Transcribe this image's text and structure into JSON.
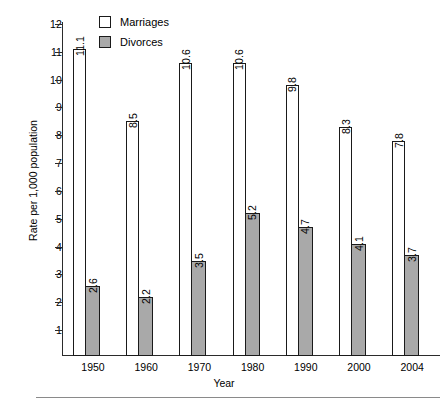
{
  "chart_data": {
    "type": "bar",
    "title": "",
    "xlabel": "Year",
    "ylabel": "Rate per 1,000 population",
    "categories": [
      "1950",
      "1960",
      "1970",
      "1980",
      "1990",
      "2000",
      "2004"
    ],
    "series": [
      {
        "name": "Marriages",
        "color": "#ffffff",
        "values": [
          11.1,
          8.5,
          10.6,
          10.6,
          9.8,
          8.3,
          7.8
        ]
      },
      {
        "name": "Divorces",
        "color": "#a9a9a9",
        "values": [
          2.6,
          2.2,
          3.5,
          5.2,
          4.7,
          4.1,
          3.7
        ]
      }
    ],
    "ylim": [
      0,
      12
    ],
    "yticks": [
      "1",
      "2",
      "3",
      "4",
      "5",
      "6",
      "7",
      "8",
      "9",
      "10",
      "11",
      "12"
    ],
    "ytick_values": [
      1,
      2,
      3,
      4,
      5,
      6,
      7,
      8,
      9,
      10,
      11,
      12
    ],
    "grid": false,
    "legend_position": "top-left-inside",
    "bar_value_labels": true,
    "bar_value_label_rotation": "vertical"
  },
  "legend": {
    "items": [
      {
        "label": "Marriages",
        "swatch": "#ffffff"
      },
      {
        "label": "Divorces",
        "swatch": "#a9a9a9"
      }
    ]
  },
  "axes": {
    "y_title": "Rate per 1,000 population",
    "x_title": "Year"
  },
  "colors": {
    "marriages_fill": "#ffffff",
    "divorces_fill": "#a9a9a9",
    "bar_stroke": "#1a1a1a",
    "axis": "#2b2b2b",
    "footer_rule": "#8a8a8a"
  }
}
